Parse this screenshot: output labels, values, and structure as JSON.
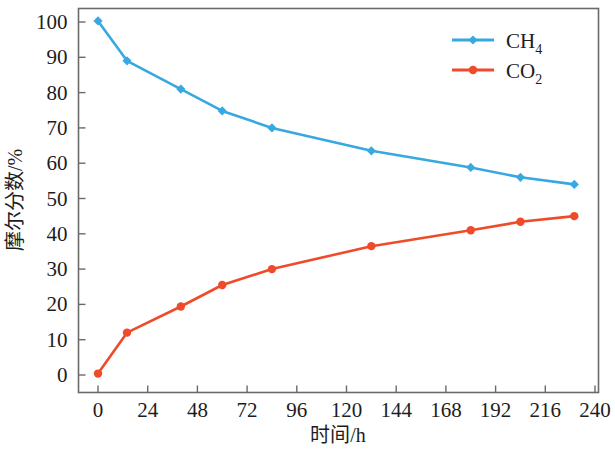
{
  "chart_data": {
    "type": "line",
    "title": "",
    "xlabel": "时间/h",
    "ylabel": "摩尔分数/%",
    "xlim": [
      0,
      240
    ],
    "ylim": [
      0,
      100
    ],
    "xticks": [
      0,
      24,
      48,
      72,
      96,
      120,
      144,
      168,
      192,
      216,
      240
    ],
    "xtick_labels": [
      "0",
      "24",
      "48",
      "72",
      "96",
      "120",
      "144",
      "168",
      "192",
      "216",
      "240"
    ],
    "yticks": [
      0,
      10,
      20,
      30,
      40,
      50,
      60,
      70,
      80,
      90,
      100
    ],
    "ytick_labels": [
      "0",
      "10",
      "20",
      "30",
      "40",
      "50",
      "60",
      "70",
      "80",
      "90",
      "100"
    ],
    "grid": false,
    "legend_position": "top-right",
    "x": [
      0,
      14,
      40,
      60,
      84,
      132,
      180,
      204,
      230
    ],
    "series": [
      {
        "name": "CH4",
        "legend_text": "CH",
        "legend_subscript": "4",
        "color": "#37A8E0",
        "marker": "diamond",
        "values": [
          100.3,
          89.0,
          81.0,
          74.8,
          70.0,
          63.5,
          58.8,
          56.0,
          54.0
        ]
      },
      {
        "name": "CO2",
        "legend_text": "CO",
        "legend_subscript": "2",
        "color": "#EF4B2A",
        "marker": "circle",
        "values": [
          0.4,
          12.0,
          19.4,
          25.5,
          30.0,
          36.5,
          41.0,
          43.4,
          45.0
        ]
      }
    ]
  },
  "axes": {
    "x_axis_title": "时间/h",
    "y_axis_title": "摩尔分数/%"
  },
  "legend": {
    "entries": [
      {
        "base": "CH",
        "sub": "4",
        "color": "#37A8E0"
      },
      {
        "base": "CO",
        "sub": "2",
        "color": "#EF4B2A"
      }
    ]
  }
}
